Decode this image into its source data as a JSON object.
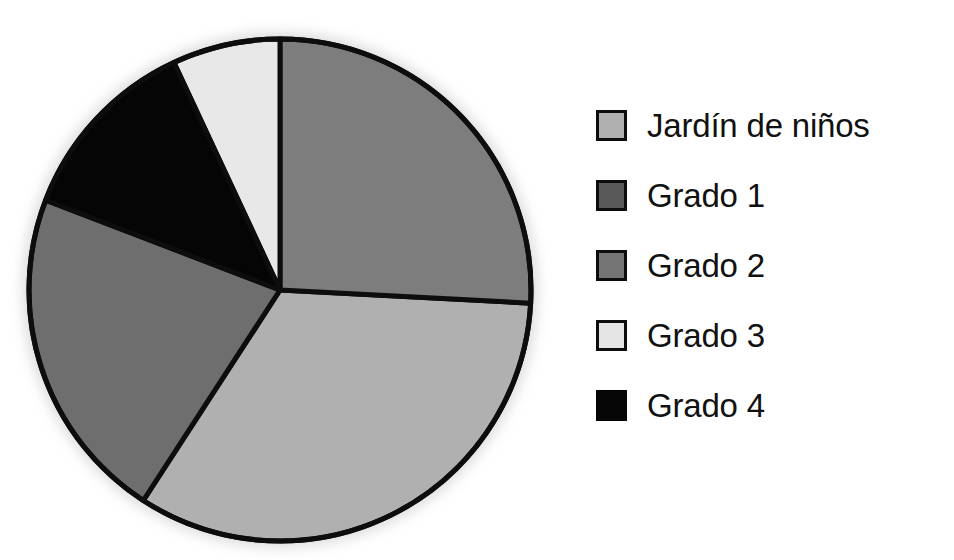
{
  "chart_data": {
    "type": "pie",
    "title": "",
    "subtitle": "",
    "xlabel": "",
    "ylabel": "",
    "grid": false,
    "legend_position": "right",
    "start_angle_deg": 0,
    "direction": "clockwise",
    "categories": [
      "Jardín de niños",
      "Grado 1",
      "Grado 2",
      "Grado 3",
      "Grado 4"
    ],
    "values": [
      33.3,
      21.7,
      12.2,
      6.9,
      25.9
    ],
    "unit": "percent",
    "slices": [
      {
        "label": "Jardín de niños",
        "value": 33.3,
        "start_deg": 93,
        "end_deg": 213,
        "sweep_deg": 120,
        "color": "#b0b0b0",
        "swatch_border": "#0d0d0d"
      },
      {
        "label": "Grado 1",
        "value": 21.7,
        "start_deg": 213,
        "end_deg": 291,
        "sweep_deg": 78,
        "color": "#6e6e6e",
        "swatch_border": "#0d0d0d"
      },
      {
        "label": "Grado 2",
        "value": 25.9,
        "start_deg": 0,
        "end_deg": 93,
        "sweep_deg": 93,
        "color": "#7d7d7d",
        "swatch_border": "#0d0d0d"
      },
      {
        "label": "Grado 3",
        "value": 6.9,
        "start_deg": 335,
        "end_deg": 360,
        "sweep_deg": 25,
        "color": "#e8e8e8",
        "swatch_border": "#0d0d0d"
      },
      {
        "label": "Grado 4",
        "value": 12.2,
        "start_deg": 291,
        "end_deg": 335,
        "sweep_deg": 44,
        "color": "#050505",
        "swatch_border": "#050505"
      }
    ],
    "geometry": {
      "center_x": 280,
      "center_y": 290,
      "radius": 251,
      "outline_color": "#0d0d0d",
      "outline_width": 5
    }
  },
  "legend": {
    "items": [
      {
        "label": "Jardín de niños",
        "color": "#b0b0b0",
        "bordered": true
      },
      {
        "label": "Grado 1",
        "color": "#595959",
        "bordered": true
      },
      {
        "label": "Grado 2",
        "color": "#757575",
        "bordered": true
      },
      {
        "label": "Grado 3",
        "color": "#e5e5e5",
        "bordered": true
      },
      {
        "label": "Grado 4",
        "color": "#050505",
        "bordered": false
      }
    ]
  }
}
